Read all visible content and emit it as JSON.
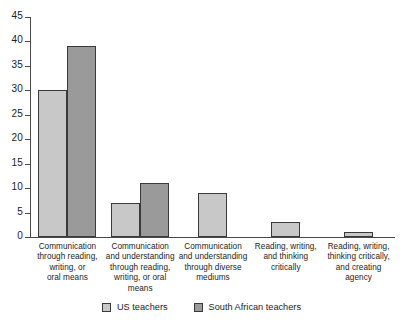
{
  "chart_data": {
    "type": "bar",
    "title": "",
    "subtitle": "",
    "xlabel": "",
    "ylabel": "",
    "ylim": [
      0,
      45
    ],
    "yticks": [
      0,
      5,
      10,
      15,
      20,
      25,
      30,
      35,
      40,
      45
    ],
    "ytick_labels": [
      "0",
      "5",
      "10",
      "15",
      "20",
      "25",
      "30",
      "35",
      "40",
      "45"
    ],
    "grid": false,
    "legend_position": "bottom-center",
    "categories": [
      "Communication through reading, writing, or oral means",
      "Communication and understanding through reading, writing, or oral means",
      "Communication and understanding through diverse mediums",
      "Reading, writing, and thinking critically",
      "Reading, writing, thinking critically, and creating agency"
    ],
    "category_lines": [
      [
        "Communication",
        "through reading,",
        "writing, or",
        "oral means"
      ],
      [
        "Communication",
        "and understanding",
        "through reading,",
        "writing, or oral",
        "means"
      ],
      [
        "Communication",
        "and understanding",
        "through diverse",
        "mediums"
      ],
      [
        "Reading, writing,",
        "and thinking",
        "critically"
      ],
      [
        "Reading, writing,",
        "thinking critically,",
        "and creating",
        "agency"
      ]
    ],
    "series": [
      {
        "name": "US teachers",
        "color": "#c8c8c8",
        "values": [
          30,
          7,
          9,
          3,
          1
        ]
      },
      {
        "name": "South African teachers",
        "color": "#9a9a9a",
        "values": [
          39,
          11,
          null,
          null,
          null
        ]
      }
    ]
  },
  "legend": {
    "items": [
      {
        "label": "US teachers",
        "swatch": "us"
      },
      {
        "label": "South African teachers",
        "swatch": "sa"
      }
    ]
  },
  "colors": {
    "us_bar": "#c8c8c8",
    "sa_bar": "#9a9a9a",
    "bar_outline": "#3a3a3a",
    "axis": "#4a4a4a",
    "text": "#1c1c1c",
    "background": "#ffffff"
  }
}
